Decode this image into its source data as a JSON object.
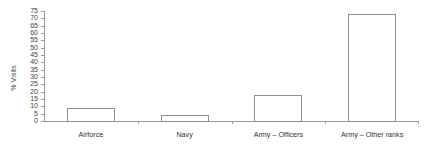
{
  "chart_data": {
    "type": "bar",
    "title": "",
    "xlabel": "",
    "ylabel": "% Visits",
    "categories": [
      "Airforce",
      "Navy",
      "Army – Officers",
      "Army – Other ranks"
    ],
    "values": [
      9,
      4,
      18,
      73
    ],
    "ylim": [
      0,
      75
    ],
    "ytick_step": 5,
    "yticks": [
      0,
      5,
      10,
      15,
      20,
      25,
      30,
      35,
      40,
      45,
      50,
      55,
      60,
      65,
      70,
      75
    ],
    "ytick_labels": [
      "0",
      "5",
      "10",
      "15",
      "20",
      "25",
      "30",
      "35",
      "40",
      "45",
      "50",
      "55",
      "60",
      "65",
      "70",
      "75"
    ],
    "grid": false,
    "legend": null,
    "legend_position": "none",
    "series": [
      {
        "name": "% Visits",
        "values": [
          9,
          4,
          18,
          73
        ]
      }
    ],
    "bar_style": {
      "fill": "#ffffff",
      "edge": "#8f8f8f"
    },
    "axis_color": "#9a9a9a"
  }
}
